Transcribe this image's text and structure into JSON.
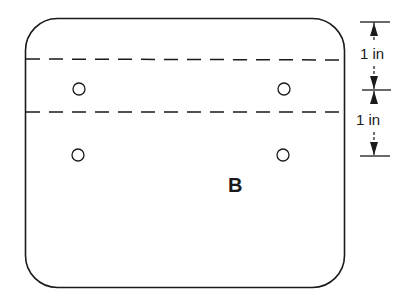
{
  "diagram": {
    "panel_label": "B",
    "dimensions": [
      {
        "label": "1 in",
        "from": "top edge",
        "to": "first fold line"
      },
      {
        "label": "1 in",
        "from": "first fold line",
        "to": "second fold line"
      }
    ],
    "fold_lines": 2,
    "holes": 4,
    "colors": {
      "stroke": "#1a1a1a",
      "background": "#ffffff"
    }
  }
}
